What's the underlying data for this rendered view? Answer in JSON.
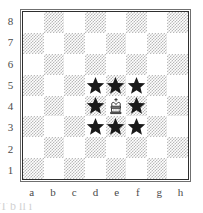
{
  "diagram": {
    "type": "chessboard",
    "board_size": 8,
    "orientation": "white-bottom",
    "rank_labels": [
      "8",
      "7",
      "6",
      "5",
      "4",
      "3",
      "2",
      "1"
    ],
    "file_labels": [
      "a",
      "b",
      "c",
      "d",
      "e",
      "f",
      "g",
      "h"
    ],
    "colors": {
      "light_square": "#ffffff",
      "dark_square_texture": "#b9b9b9",
      "border_outer": "#6f6f6f",
      "border_inner": "#2e2e2e",
      "label_text": "#4a4a4a",
      "piece_black": "#1a1a1a",
      "piece_white_fill": "#ffffff",
      "piece_white_stroke": "#1a1a1a"
    },
    "pieces": [
      {
        "square": "e4",
        "name": "white-king",
        "glyph": "king-white",
        "color": "white"
      }
    ],
    "markers": [
      {
        "square": "d5",
        "name": "star-marker",
        "glyph": "star"
      },
      {
        "square": "e5",
        "name": "star-marker",
        "glyph": "star"
      },
      {
        "square": "f5",
        "name": "star-marker",
        "glyph": "star"
      },
      {
        "square": "d4",
        "name": "star-marker",
        "glyph": "star"
      },
      {
        "square": "f4",
        "name": "star-marker",
        "glyph": "star"
      },
      {
        "square": "d3",
        "name": "star-marker",
        "glyph": "star"
      },
      {
        "square": "e3",
        "name": "star-marker",
        "glyph": "star"
      },
      {
        "square": "f3",
        "name": "star-marker",
        "glyph": "star"
      }
    ],
    "bottom_caption": "T                                 b  ll     i"
  }
}
